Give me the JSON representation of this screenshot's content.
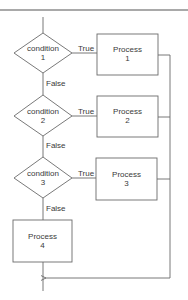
{
  "diagram": {
    "type": "flowchart",
    "decisions": [
      {
        "id": "c1",
        "line1": "condition",
        "line2": "1"
      },
      {
        "id": "c2",
        "line1": "condition",
        "line2": "2"
      },
      {
        "id": "c3",
        "line1": "condition",
        "line2": "3"
      }
    ],
    "processes": [
      {
        "id": "p1",
        "line1": "Process",
        "line2": "1"
      },
      {
        "id": "p2",
        "line1": "Process",
        "line2": "2"
      },
      {
        "id": "p3",
        "line1": "Process",
        "line2": "3"
      },
      {
        "id": "p4",
        "line1": "Process",
        "line2": "4"
      }
    ],
    "edge_labels": {
      "true": "True",
      "false": "False"
    },
    "edges": [
      {
        "from": "c1",
        "to": "p1",
        "label": "True"
      },
      {
        "from": "c1",
        "to": "c2",
        "label": "False"
      },
      {
        "from": "c2",
        "to": "p2",
        "label": "True"
      },
      {
        "from": "c2",
        "to": "c3",
        "label": "False"
      },
      {
        "from": "c3",
        "to": "p3",
        "label": "True"
      },
      {
        "from": "c3",
        "to": "p4",
        "label": "False"
      },
      {
        "from": "p1",
        "to": "merge",
        "label": ""
      },
      {
        "from": "p2",
        "to": "merge",
        "label": ""
      },
      {
        "from": "p3",
        "to": "merge",
        "label": ""
      },
      {
        "from": "p4",
        "to": "merge",
        "label": ""
      }
    ],
    "colors": {
      "line": "#6a6a6a",
      "text": "#3a3a3a",
      "background": "#ffffff",
      "top_rule": "#555555"
    }
  }
}
